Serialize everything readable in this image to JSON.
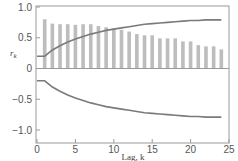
{
  "chart_data": {
    "type": "bar",
    "title": "",
    "xlabel": "Lag, k",
    "ylabel": "r_k",
    "xlim": [
      0,
      25
    ],
    "ylim": [
      -1.0,
      1.0
    ],
    "xticks": [
      0,
      5,
      10,
      15,
      20,
      25
    ],
    "yticks": [
      1.0,
      0.5,
      0,
      -0.5,
      -1.0
    ],
    "ytick_labels": [
      "1.0",
      "0.5",
      "0",
      "−0.5",
      "−1.0"
    ],
    "grid": false,
    "bars": {
      "name": "Sample autocorrelation",
      "x": [
        1,
        2,
        3,
        4,
        5,
        6,
        7,
        8,
        9,
        10,
        11,
        12,
        13,
        14,
        15,
        16,
        17,
        18,
        19,
        20,
        21,
        22,
        23,
        24
      ],
      "values": [
        0.8,
        0.73,
        0.72,
        0.72,
        0.71,
        0.72,
        0.72,
        0.69,
        0.67,
        0.65,
        0.63,
        0.6,
        0.56,
        0.54,
        0.54,
        0.49,
        0.49,
        0.49,
        0.44,
        0.44,
        0.38,
        0.36,
        0.36,
        0.31
      ],
      "color": "#bdbdbd"
    },
    "limit_curves": {
      "name": "Approximate 95% limits",
      "color": "#7a7a7a",
      "x": [
        0,
        1,
        2,
        3,
        4,
        5,
        6,
        7,
        8,
        9,
        10,
        11,
        12,
        13,
        14,
        15,
        16,
        17,
        18,
        19,
        20,
        21,
        22,
        23,
        24
      ],
      "upper": [
        0.2,
        0.2,
        0.3,
        0.37,
        0.43,
        0.48,
        0.52,
        0.56,
        0.59,
        0.62,
        0.64,
        0.66,
        0.68,
        0.7,
        0.72,
        0.73,
        0.74,
        0.75,
        0.76,
        0.77,
        0.78,
        0.78,
        0.79,
        0.79,
        0.79
      ],
      "lower": [
        -0.2,
        -0.2,
        -0.3,
        -0.37,
        -0.43,
        -0.48,
        -0.52,
        -0.56,
        -0.59,
        -0.62,
        -0.64,
        -0.66,
        -0.68,
        -0.7,
        -0.72,
        -0.73,
        -0.74,
        -0.75,
        -0.76,
        -0.77,
        -0.78,
        -0.78,
        -0.79,
        -0.79,
        -0.79
      ]
    }
  }
}
